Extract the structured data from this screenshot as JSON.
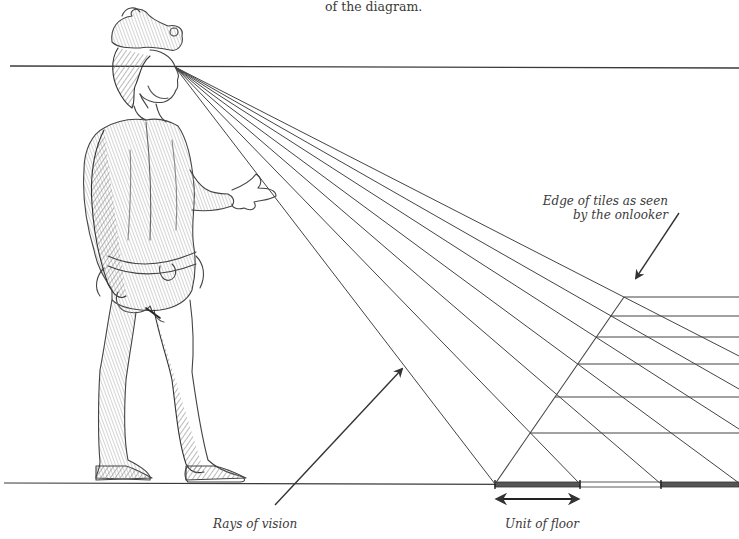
{
  "caption_top": "of the diagram.",
  "labels": {
    "edge_of_tiles_line1": "Edge of tiles as seen",
    "edge_of_tiles_line2": "by the onlooker",
    "rays_of_vision": "Rays of vision",
    "unit_of_floor": "Unit of floor"
  },
  "figure": {
    "eye_point": [
      175,
      67
    ]
  },
  "geometry": {
    "horizon_y": 66,
    "floor_y": 484,
    "tile_edge_points": [
      [
        495,
        484
      ],
      [
        530,
        433
      ],
      [
        555,
        397
      ],
      [
        578,
        364
      ],
      [
        596,
        337
      ],
      [
        611,
        316
      ],
      [
        624,
        297
      ]
    ],
    "tile_horizontal_ys": [
      297,
      316,
      337,
      364,
      397,
      433
    ],
    "floor_units": [
      {
        "from": 495,
        "to": 580,
        "fill": "dark"
      },
      {
        "from": 580,
        "to": 661,
        "fill": "light"
      },
      {
        "from": 661,
        "to": 739,
        "fill": "dark"
      }
    ]
  },
  "colors": {
    "line": "#3a3a3a",
    "sketch": "#555555",
    "shade": "#9a9a9a",
    "text": "#3a3a3a"
  }
}
